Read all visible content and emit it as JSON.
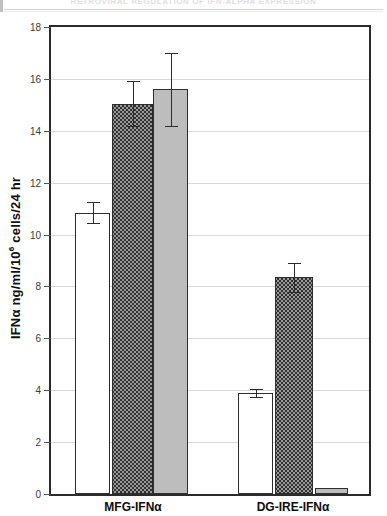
{
  "header": {
    "running_title": "RETROVIRAL REGULATION OF IFN-ALPHA EXPRESSION"
  },
  "chart_data": {
    "type": "bar",
    "title": "",
    "xlabel": "",
    "ylabel": "IFNα ng/ml/10⁶ cells/24 hr",
    "ylabel_parts": {
      "prefix": "IFNα ng/ml/10",
      "superscript": "6",
      "suffix": " cells/24 hr"
    },
    "ylim": [
      0,
      18
    ],
    "ytick_values": [
      0,
      2,
      4,
      6,
      8,
      10,
      12,
      14,
      16,
      18
    ],
    "ytick_labels": [
      "0",
      "2",
      "4",
      "6",
      "8",
      "10",
      "12",
      "14",
      "16",
      "18"
    ],
    "grid": true,
    "grid_axis": "y",
    "legend": null,
    "categories": [
      "MFG-IFNα",
      "DG-IRE-IFNα"
    ],
    "series": [
      {
        "name": "open",
        "fill": "white",
        "values": [
          10.85,
          3.9
        ],
        "errors": [
          0.4,
          0.15
        ]
      },
      {
        "name": "hatched",
        "fill": "hatch",
        "values": [
          15.05,
          8.35
        ],
        "errors": [
          0.85,
          0.55
        ]
      },
      {
        "name": "solid",
        "fill": "gray",
        "values": [
          15.6,
          0.25
        ],
        "errors": [
          1.4,
          0.0
        ]
      }
    ],
    "colors": {
      "open_fill": "#ffffff",
      "hatch_fill": "#9a9a9a",
      "solid_fill": "#bdbdbd",
      "bar_stroke": "#2e2e2e",
      "gridline": "#d9d9d9",
      "axis": "#2b2b2b"
    }
  }
}
